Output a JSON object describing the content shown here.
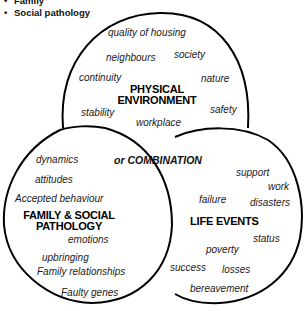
{
  "bullets": [
    "Family",
    "Social pathology"
  ],
  "circles": {
    "physical": {
      "title_line1": "PHYSICAL",
      "title_line2": "ENVIRONMENT",
      "items": [
        "quality of housing",
        "neighbours",
        "society",
        "continuity",
        "nature",
        "stability",
        "safety",
        "workplace"
      ]
    },
    "family": {
      "title_line1": "FAMILY & SOCIAL",
      "title_line2": "PATHOLOGY",
      "items": [
        "dynamics",
        "attitudes",
        "Accepted behaviour",
        "emotions",
        "upbringing",
        "Family relationships",
        "Faulty genes"
      ]
    },
    "life": {
      "title": "LIFE EVENTS",
      "items": [
        "support",
        "work",
        "failure",
        "disasters",
        "status",
        "poverty",
        "success",
        "losses",
        "bereavement"
      ]
    }
  },
  "combination_label": "or COMBINATION",
  "colors": {
    "line": "#000000",
    "text": "#1a1a1a",
    "background": "#ffffff"
  }
}
